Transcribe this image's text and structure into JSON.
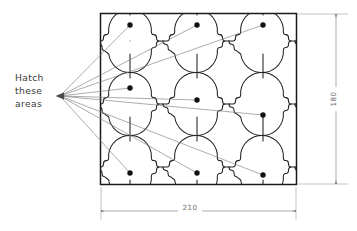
{
  "drawing": {
    "title": "Hatch pattern layout drawing",
    "annotation": {
      "name": "hatch-note",
      "lines": [
        "Hatch",
        "these",
        "areas"
      ],
      "anchor_x": 57,
      "anchor_y": 96
    },
    "dimensions": [
      {
        "name": "width-dimension",
        "label": "210",
        "orientation": "horizontal",
        "value": 210
      },
      {
        "name": "height-dimension",
        "label": "180",
        "orientation": "vertical",
        "value": 180
      }
    ],
    "rectangle": {
      "x": 100,
      "y": 13,
      "width": 197,
      "height": 172
    },
    "pattern": {
      "type": "quatrefoil-ogee-tile",
      "columns": 4,
      "rows": 3,
      "tile_width": 65.7,
      "tile_height": 57.3,
      "stroke": "#1a1a1a",
      "fill": "#ffffff"
    },
    "center_dots": [
      {
        "x": 130,
        "y": 25
      },
      {
        "x": 197,
        "y": 25
      },
      {
        "x": 263,
        "y": 25
      },
      {
        "x": 130,
        "y": 88
      },
      {
        "x": 197,
        "y": 100
      },
      {
        "x": 263,
        "y": 115
      },
      {
        "x": 130,
        "y": 173
      },
      {
        "x": 197,
        "y": 173
      },
      {
        "x": 263,
        "y": 175
      }
    ],
    "leader_endpoints": [
      {
        "x": 130,
        "y": 25
      },
      {
        "x": 197,
        "y": 25
      },
      {
        "x": 263,
        "y": 25
      },
      {
        "x": 130,
        "y": 88
      },
      {
        "x": 197,
        "y": 100
      },
      {
        "x": 263,
        "y": 115
      },
      {
        "x": 130,
        "y": 173
      },
      {
        "x": 197,
        "y": 173
      },
      {
        "x": 263,
        "y": 175
      }
    ],
    "colors": {
      "outline": "#1a1a1a",
      "pattern_stroke": "#222222",
      "leader": "#7e7e7e",
      "dimension": "#8a8a8a",
      "text": "#3a3a3a",
      "dim_text": "#6b6b6b",
      "background": "#ffffff"
    }
  }
}
